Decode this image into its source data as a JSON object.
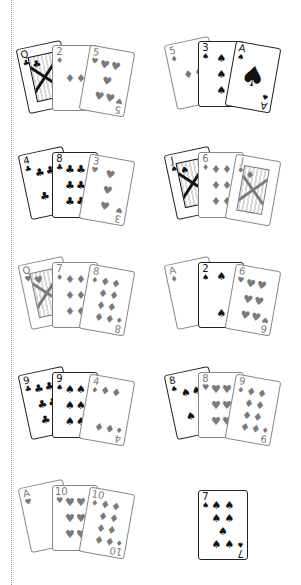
{
  "layout": {
    "columns": 2,
    "rows": 5
  },
  "colors": {
    "black_suit": "#111111",
    "gray_suit": "#7a7a7a",
    "divider": "#9a9a9a",
    "background": "#ffffff"
  },
  "suits": {
    "clubs": "♣",
    "spades": "♠",
    "hearts": "♥",
    "diamonds": "♦"
  },
  "hands": [
    {
      "id": "hand-1",
      "column": "left",
      "cards": [
        {
          "rank": "Q",
          "suit": "♣",
          "tone": "black",
          "kind": "face"
        },
        {
          "rank": "2",
          "suit": "♦",
          "tone": "gray",
          "kind": "pips"
        },
        {
          "rank": "5",
          "suit": "♥",
          "tone": "gray",
          "kind": "pips"
        }
      ]
    },
    {
      "id": "hand-2",
      "column": "right",
      "cards": [
        {
          "rank": "5",
          "suit": "♦",
          "tone": "gray",
          "kind": "pips"
        },
        {
          "rank": "3",
          "suit": "♠",
          "tone": "black",
          "kind": "pips"
        },
        {
          "rank": "A",
          "suit": "♠",
          "tone": "black",
          "kind": "ace"
        }
      ]
    },
    {
      "id": "hand-3",
      "column": "left",
      "cards": [
        {
          "rank": "4",
          "suit": "♣",
          "tone": "black",
          "kind": "pips"
        },
        {
          "rank": "8",
          "suit": "♣",
          "tone": "black",
          "kind": "pips"
        },
        {
          "rank": "3",
          "suit": "♥",
          "tone": "gray",
          "kind": "pips"
        }
      ]
    },
    {
      "id": "hand-4",
      "column": "right",
      "cards": [
        {
          "rank": "J",
          "suit": "♠",
          "tone": "black",
          "kind": "face"
        },
        {
          "rank": "6",
          "suit": "♦",
          "tone": "gray",
          "kind": "pips"
        },
        {
          "rank": "J",
          "suit": "♦",
          "tone": "gray",
          "kind": "face"
        }
      ]
    },
    {
      "id": "hand-5",
      "column": "left",
      "cards": [
        {
          "rank": "Q",
          "suit": "♥",
          "tone": "gray",
          "kind": "face"
        },
        {
          "rank": "7",
          "suit": "♦",
          "tone": "gray",
          "kind": "pips"
        },
        {
          "rank": "8",
          "suit": "♦",
          "tone": "gray",
          "kind": "pips"
        }
      ]
    },
    {
      "id": "hand-6",
      "column": "right",
      "cards": [
        {
          "rank": "A",
          "suit": "♦",
          "tone": "gray",
          "kind": "pips"
        },
        {
          "rank": "2",
          "suit": "♠",
          "tone": "black",
          "kind": "pips"
        },
        {
          "rank": "6",
          "suit": "♥",
          "tone": "gray",
          "kind": "pips"
        }
      ]
    },
    {
      "id": "hand-7",
      "column": "left",
      "cards": [
        {
          "rank": "9",
          "suit": "♣",
          "tone": "black",
          "kind": "pips"
        },
        {
          "rank": "9",
          "suit": "♠",
          "tone": "black",
          "kind": "pips"
        },
        {
          "rank": "4",
          "suit": "♦",
          "tone": "gray",
          "kind": "pips"
        }
      ]
    },
    {
      "id": "hand-8",
      "column": "right",
      "cards": [
        {
          "rank": "8",
          "suit": "♠",
          "tone": "black",
          "kind": "pips"
        },
        {
          "rank": "8",
          "suit": "♥",
          "tone": "gray",
          "kind": "pips"
        },
        {
          "rank": "9",
          "suit": "♦",
          "tone": "gray",
          "kind": "pips"
        }
      ]
    },
    {
      "id": "hand-9",
      "column": "left",
      "cards": [
        {
          "rank": "A",
          "suit": "♥",
          "tone": "gray",
          "kind": "pips"
        },
        {
          "rank": "10",
          "suit": "♥",
          "tone": "gray",
          "kind": "pips"
        },
        {
          "rank": "10",
          "suit": "♦",
          "tone": "gray",
          "kind": "pips"
        }
      ]
    },
    {
      "id": "hand-10",
      "column": "right",
      "cards": [
        {
          "rank": "7",
          "suit": "♠",
          "tone": "black",
          "kind": "pips"
        }
      ]
    }
  ]
}
